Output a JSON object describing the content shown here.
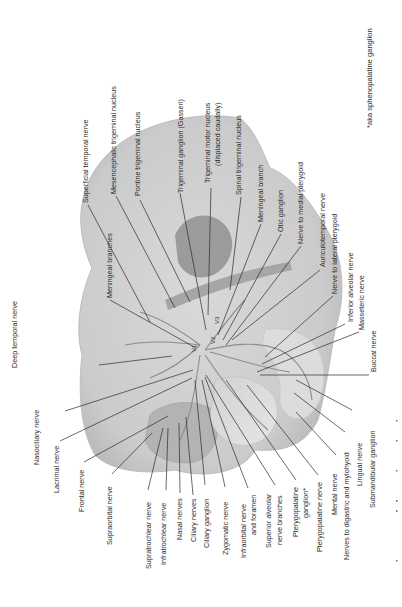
{
  "figure": {
    "footnote": "*aka sphenopalatine ganglion",
    "division_marks": [
      "V1",
      "V2",
      "V3"
    ],
    "colors": {
      "skull": "#cfcfcf",
      "skull_edge": "#bdbdbd",
      "brainstem": "#9b9b9b",
      "text": "#2a2a2a",
      "leader": "#2b2b2b"
    },
    "labels": {
      "superficial_temporal": "Superficial temporal nerve",
      "mesencephalic": "Mesencephalic trigeminal nucleus",
      "pontine": "Pontine trigeminal nucleus",
      "trigeminal_ganglion": "Trigeminal ganglion (Gasseri)",
      "motor_nucleus_1": "Trigeminal motor nucleus",
      "motor_nucleus_2": "(displaced caudally)",
      "spinal": "Spinal trigeminal nucleus",
      "meningeal_branch": "Meningeal branch",
      "otic": "Otic ganglion",
      "medial_pterygoid": "Nerve to medial pterygoid",
      "auriculotemporal": "Auriculotemporal nerve",
      "lateral_pterygoid": "Nerve to lateral pterygoid",
      "inferior_alveolar": "Inferior alveolar nerve",
      "masseteric": "Masseteric nerve",
      "buccal": "Buccal nerve",
      "meningeal_branches": "Meningeal branches",
      "deep_temporal": "Deep temporal nerve",
      "nasociliary": "Nasociliary nerve",
      "lacrimal": "Lacrimal nerve",
      "frontal": "Frontal nerve",
      "supraorbital": "Supraorbital nerve",
      "supratrochlear": "Supratrochlear nerve",
      "infratrochlear": "Infratrochlear nerve",
      "nasal": "Nasal nerves",
      "ciliary_nerves": "Ciliary nerves",
      "ciliary_ganglion": "Ciliary ganglion",
      "zygomatic": "Zygomatic nerve",
      "infraorbital_1": "Infraorbital nerve",
      "infraorbital_2": "and foramen",
      "superior_alveolar_1": "Superior alveolar",
      "superior_alveolar_2": "nerve branches",
      "pterygopalatine_ganglion_1": "Pterygopalatine",
      "pterygopalatine_ganglion_2": "ganglion*",
      "pterygopalatine_nerve": "Pterygopalatine nerve",
      "nerves_digastric": "Nerves to digastric and mylohyoid",
      "mental": "Mental nerve",
      "lingual": "Lingual nerve",
      "submandibular": "Submandibular ganglion"
    }
  }
}
